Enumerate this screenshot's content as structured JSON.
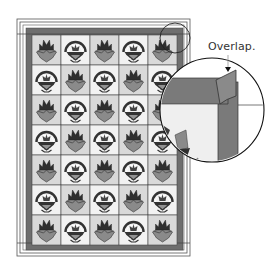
{
  "diagram": {
    "type": "quilt-layout-with-detail-callout",
    "grid": {
      "columns": 5,
      "rows": 7,
      "pattern_rows": [
        [
          "tulip",
          "basket",
          "tulip",
          "basket",
          "tulip"
        ],
        [
          "basket",
          "tulip",
          "basket",
          "tulip",
          "basket"
        ],
        [
          "tulip",
          "basket",
          "tulip",
          "basket",
          "tulip"
        ],
        [
          "basket",
          "tulip",
          "basket",
          "tulip",
          "basket"
        ],
        [
          "tulip",
          "basket",
          "tulip",
          "basket",
          "tulip"
        ],
        [
          "basket",
          "tulip",
          "basket",
          "tulip",
          "basket"
        ],
        [
          "tulip",
          "basket",
          "tulip",
          "basket",
          "tulip"
        ]
      ]
    },
    "callout": {
      "label": "Overlap.",
      "description": "magnified corner showing border strip overlapping at corner"
    },
    "colors": {
      "border_dark": "#6e6e6e",
      "cell_light": "#f2f2f2",
      "cell_shade": "#d9d9d9",
      "motif_dark": "#3a3a3a",
      "motif_mid": "#8a8a8a",
      "frame_line": "#555555"
    }
  }
}
